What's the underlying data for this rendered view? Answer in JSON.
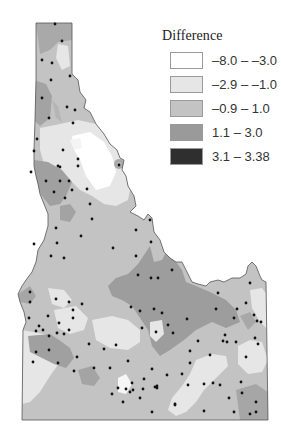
{
  "legend": {
    "title": "Difference",
    "items": [
      {
        "label": "–8.0 – –3.0",
        "color": "#ffffff"
      },
      {
        "label": "–2.9 – –1.0",
        "color": "#e6e6e6"
      },
      {
        "label": "–0.9 – 1.0",
        "color": "#c3c3c3"
      },
      {
        "label": "1.1 – 3.0",
        "color": "#9a9a9a"
      },
      {
        "label": "3.1 – 3.38",
        "color": "#2f2f2f"
      }
    ]
  },
  "map": {
    "region": "Idaho",
    "outline_color": "#555555",
    "station_color": "#111111"
  }
}
